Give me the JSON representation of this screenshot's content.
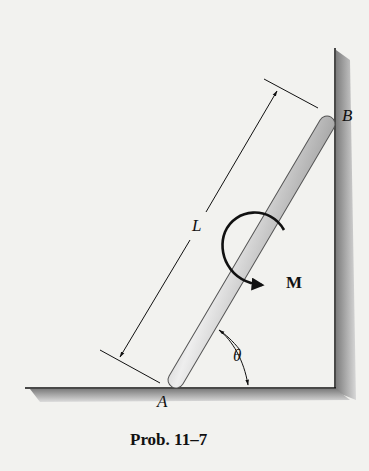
{
  "figure": {
    "caption": "Prob. 11–7",
    "labels": {
      "point_a": "A",
      "point_b": "B",
      "length": "L",
      "moment": "M",
      "angle": "θ"
    },
    "colors": {
      "background": "#f2f2ef",
      "wall_shadow": "#8f8f8f",
      "rod_light": "#e6e6e6",
      "rod_dark": "#7a7a7a",
      "line": "#111111"
    }
  }
}
